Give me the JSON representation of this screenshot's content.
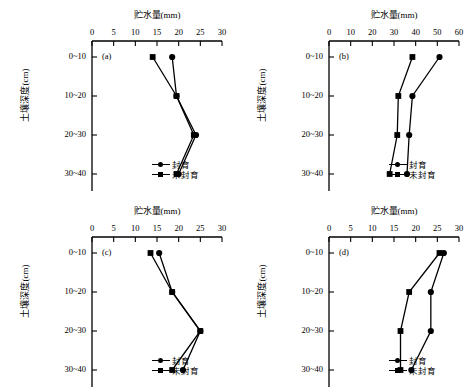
{
  "figure": {
    "axis_title": "贮水量(mm)",
    "y_axis_label": "土壤深度(cm)",
    "depth_categories": [
      "0~10",
      "10~20",
      "20~30",
      "30~40"
    ],
    "series_names": {
      "enclosed": "封育",
      "unenclosed": "未封育"
    },
    "markers": {
      "enclosed": "circle",
      "unenclosed": "square"
    },
    "line_color": "#000000"
  },
  "chart_data": [
    {
      "type": "line",
      "panel": "(a)",
      "title": "贮水量(mm)",
      "xlabel": "贮水量(mm)",
      "ylabel": "土壤深度(cm)",
      "categories": [
        "0~10",
        "10~20",
        "20~30",
        "30~40"
      ],
      "xlim": [
        0,
        30
      ],
      "xticks": [
        0,
        5,
        10,
        15,
        20,
        25,
        30
      ],
      "grid": false,
      "legend_position": "bottom-right",
      "series": [
        {
          "name": "封育",
          "marker": "circle",
          "values": [
            18.5,
            19.5,
            24.0,
            20.0
          ]
        },
        {
          "name": "未封育",
          "marker": "square",
          "values": [
            14.0,
            19.5,
            23.5,
            19.5
          ]
        }
      ]
    },
    {
      "type": "line",
      "panel": "(b)",
      "title": "贮水量(mm)",
      "xlabel": "贮水量(mm)",
      "ylabel": "土壤深度(cm)",
      "categories": [
        "0~10",
        "10~20",
        "20~30",
        "30~40"
      ],
      "xlim": [
        0,
        60
      ],
      "xticks": [
        0,
        10,
        20,
        30,
        40,
        50,
        60
      ],
      "grid": false,
      "legend_position": "bottom-right",
      "series": [
        {
          "name": "封育",
          "marker": "circle",
          "values": [
            51.0,
            38.5,
            37.0,
            36.0
          ]
        },
        {
          "name": "未封育",
          "marker": "square",
          "values": [
            38.5,
            32.0,
            31.5,
            28.0
          ]
        }
      ]
    },
    {
      "type": "line",
      "panel": "(c)",
      "title": "贮水量(mm)",
      "xlabel": "贮水量(mm)",
      "ylabel": "土壤深度(cm)",
      "categories": [
        "0~10",
        "10~20",
        "20~30",
        "30~40"
      ],
      "xlim": [
        0,
        30
      ],
      "xticks": [
        0,
        5,
        10,
        15,
        20,
        25,
        30
      ],
      "grid": false,
      "legend_position": "bottom-right",
      "series": [
        {
          "name": "封育",
          "marker": "circle",
          "values": [
            15.5,
            18.5,
            25.0,
            21.0
          ]
        },
        {
          "name": "未封育",
          "marker": "square",
          "values": [
            13.5,
            18.5,
            25.0,
            18.5
          ]
        }
      ]
    },
    {
      "type": "line",
      "panel": "(d)",
      "title": "贮水量(mm)",
      "xlabel": "贮水量(mm)",
      "ylabel": "土壤深度(cm)",
      "categories": [
        "0~10",
        "10~20",
        "20~30",
        "30~40"
      ],
      "xlim": [
        0,
        30
      ],
      "xticks": [
        0,
        5,
        10,
        15,
        20,
        25,
        30
      ],
      "grid": false,
      "legend_position": "bottom-right",
      "series": [
        {
          "name": "封育",
          "marker": "circle",
          "values": [
            26.5,
            23.5,
            23.5,
            19.0
          ]
        },
        {
          "name": "未封育",
          "marker": "square",
          "values": [
            25.5,
            18.5,
            16.5,
            16.5
          ]
        }
      ]
    }
  ]
}
